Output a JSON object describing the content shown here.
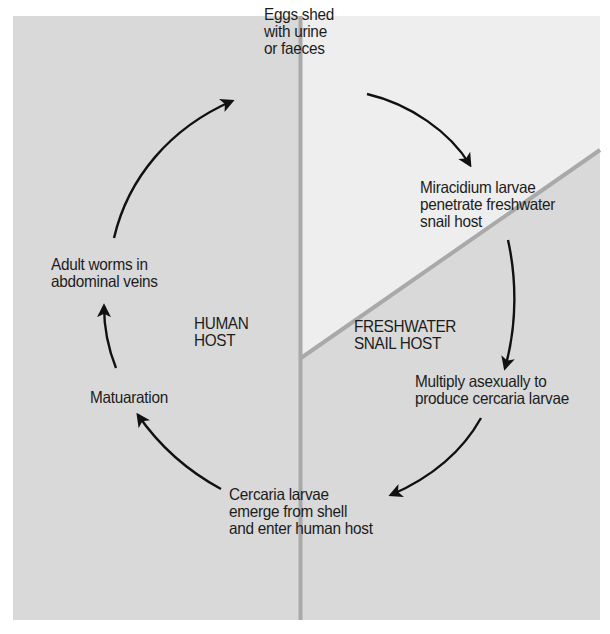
{
  "colors": {
    "panel_background": "#d9d9d9",
    "snail_outside_region": "#eeeeee",
    "divider": "#a9a9a9",
    "arrow": "#111111",
    "text": "#1c1c1c"
  },
  "regions": {
    "human": {
      "label": "HUMAN\nHOST"
    },
    "snail": {
      "label": "FRESHWATER\nSNAIL HOST"
    }
  },
  "stages": [
    {
      "id": "eggs",
      "label": "Eggs shed\nwith urine\nor faeces"
    },
    {
      "id": "miracidium",
      "label": "Miracidium larvae\npenetrate freshwater\nsnail host"
    },
    {
      "id": "multiply",
      "label": "Multiply asexually to\nproduce cercaria larvae"
    },
    {
      "id": "cercaria",
      "label": "Cercaria larvae\nemerge from shell\nand enter human host"
    },
    {
      "id": "maturation",
      "label": "Matuaration"
    },
    {
      "id": "adult",
      "label": "Adult worms in\nabdominal veins"
    }
  ],
  "cycle_arrows": [
    {
      "from": "adult",
      "to": "eggs"
    },
    {
      "from": "eggs",
      "to": "miracidium"
    },
    {
      "from": "miracidium",
      "to": "multiply"
    },
    {
      "from": "multiply",
      "to": "cercaria"
    },
    {
      "from": "cercaria",
      "to": "maturation"
    },
    {
      "from": "maturation",
      "to": "adult"
    }
  ]
}
